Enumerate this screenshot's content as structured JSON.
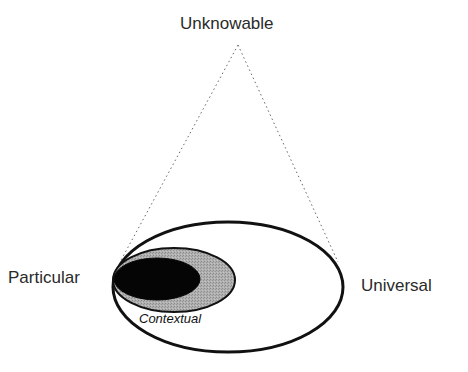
{
  "diagram": {
    "labels": {
      "apex": "Unknowable",
      "left": "Particular",
      "right": "Universal",
      "inner": "Contextual"
    },
    "colors": {
      "outline": "#111111",
      "contextual_fill": "#a8a8a8",
      "particular_core_fill": "#050505",
      "dotted_line": "#666666",
      "background": "#ffffff"
    },
    "shapes": {
      "apex_point": [
        238,
        45
      ],
      "outer_ellipse": {
        "cx": 228,
        "cy": 287,
        "rx": 115,
        "ry": 65
      },
      "contextual_ellipse": {
        "cx": 174,
        "cy": 280,
        "rx": 61,
        "ry": 32
      },
      "core_ellipse": {
        "cx": 157,
        "cy": 279,
        "rx": 43,
        "ry": 21
      },
      "left_line_end": [
        120,
        262
      ],
      "right_line_end": [
        338,
        262
      ]
    }
  }
}
